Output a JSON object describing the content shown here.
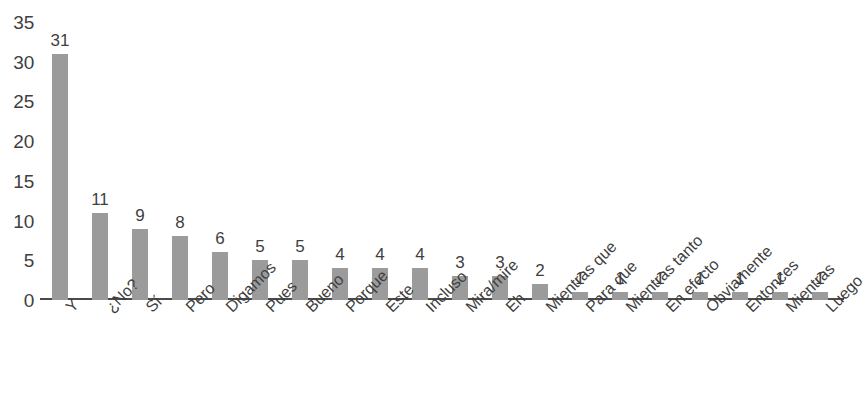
{
  "chart_data": {
    "type": "bar",
    "title": "",
    "subtitle": "",
    "xlabel": "",
    "ylabel": "",
    "ylim": [
      0,
      35
    ],
    "ytick_step": 5,
    "yticks": [
      0,
      5,
      10,
      15,
      20,
      25,
      30,
      35
    ],
    "ytick_labels": [
      "0",
      "5",
      "10",
      "15",
      "20",
      "25",
      "30",
      "35"
    ],
    "grid": false,
    "legend": null,
    "legend_position": "none",
    "bar_color": "#9b9b9b",
    "axis_color": "#4a4a4a",
    "text_color": "#3f3f3f",
    "background_color": "#ffffff",
    "data_labels_shown": true,
    "x_label_rotation": -45,
    "categories": [
      "Y",
      "¿No?",
      "Sí",
      "Pero",
      "Digamos",
      "Pues",
      "Bueno",
      "Porque",
      "Este",
      "Incluso",
      "Mira/mire",
      "Eh",
      "Mientras que",
      "Para que",
      "Mientras tanto",
      "En efecto",
      "Obviamente",
      "Entonces",
      "Mientras",
      "Luego"
    ],
    "values": [
      31,
      11,
      9,
      8,
      6,
      5,
      5,
      4,
      4,
      4,
      3,
      3,
      2,
      1,
      1,
      1,
      1,
      1,
      1,
      1
    ],
    "value_labels": [
      "31",
      "11",
      "9",
      "8",
      "6",
      "5",
      "5",
      "4",
      "4",
      "4",
      "3",
      "3",
      "2",
      "1",
      "1",
      "1",
      "1",
      "1",
      "1",
      "1"
    ]
  }
}
